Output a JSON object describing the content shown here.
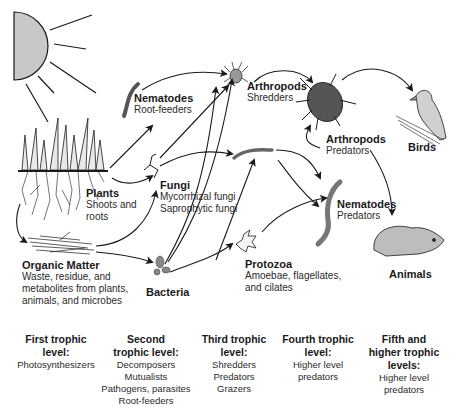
{
  "nodes": {
    "plants": {
      "title": "Plants",
      "lines": [
        "Shoots and",
        "roots"
      ]
    },
    "organic_matter": {
      "title": "Organic Matter",
      "lines": [
        "Waste, residue, and",
        "metabolites from plants,",
        "animals, and microbes"
      ]
    },
    "nematodes_root": {
      "title": "Nematodes",
      "lines": [
        "Root-feeders"
      ]
    },
    "fungi": {
      "title": "Fungi",
      "lines": [
        "Mycorrhizal fungi",
        "Saprophytic fungi"
      ]
    },
    "bacteria": {
      "title": "Bacteria",
      "lines": []
    },
    "arthropods_shred": {
      "title": "Arthropods",
      "lines": [
        "Shredders"
      ]
    },
    "protozoa": {
      "title": "Protozoa",
      "lines": [
        "Amoebae, flagellates,",
        "and cilates"
      ]
    },
    "arthropods_pred": {
      "title": "Arthropods",
      "lines": [
        "Predators"
      ]
    },
    "nematodes_pred": {
      "title": "Nematodes",
      "lines": [
        "Predators"
      ]
    },
    "birds": {
      "title": "Birds",
      "lines": []
    },
    "animals": {
      "title": "Animals",
      "lines": []
    }
  },
  "levels": [
    {
      "heading": [
        "First trophic",
        "level:"
      ],
      "items": [
        "Photosynthesizers"
      ]
    },
    {
      "heading": [
        "Second",
        "trophic level:"
      ],
      "items": [
        "Decomposers",
        "Mutualists",
        "Pathogens, parasites",
        "Root-feeders"
      ]
    },
    {
      "heading": [
        "Third trophic",
        "level:"
      ],
      "items": [
        "Shredders",
        "Predators",
        "Grazers"
      ]
    },
    {
      "heading": [
        "Fourth trophic",
        "level:"
      ],
      "items": [
        "Higher level",
        "predators"
      ]
    },
    {
      "heading": [
        "Fifth and",
        "higher trophic",
        "levels:"
      ],
      "items": [
        "Higher level",
        "predators"
      ]
    }
  ],
  "colors": {
    "organism_fill": "#b3b3b3",
    "sun_fill": "#c8c8c8",
    "stroke": "#1a1a1a"
  }
}
